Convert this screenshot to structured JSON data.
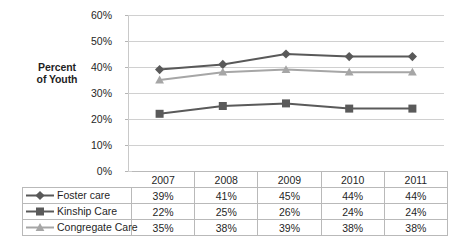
{
  "chart_data": {
    "type": "line",
    "title": "",
    "xlabel": "",
    "ylabel": "Percent of Youth",
    "ylabel_line1": "Percent",
    "ylabel_line2": "of Youth",
    "categories": [
      "2007",
      "2008",
      "2009",
      "2010",
      "2011"
    ],
    "ytick_labels": [
      "60%",
      "50%",
      "40%",
      "30%",
      "20%",
      "10%",
      "0%"
    ],
    "ytick_values": [
      60,
      50,
      40,
      30,
      20,
      10,
      0
    ],
    "ylim": [
      0,
      60
    ],
    "grid": true,
    "legend_position": "data-table-below",
    "series": [
      {
        "name": "Foster care",
        "marker": "diamond",
        "color": "#595959",
        "values": [
          39,
          41,
          45,
          44,
          44
        ],
        "labels": [
          "39%",
          "41%",
          "45%",
          "44%",
          "44%"
        ]
      },
      {
        "name": "Kinship Care",
        "marker": "square",
        "color": "#5a5a5a",
        "values": [
          22,
          25,
          26,
          24,
          24
        ],
        "labels": [
          "22%",
          "25%",
          "26%",
          "24%",
          "24%"
        ]
      },
      {
        "name": "Congregate Care",
        "marker": "triangle",
        "color": "#a6a6a6",
        "values": [
          35,
          38,
          39,
          38,
          38
        ],
        "labels": [
          "35%",
          "38%",
          "39%",
          "38%",
          "38%"
        ]
      }
    ]
  },
  "table": {
    "corner_label": "",
    "column_headers": [
      "2007",
      "2008",
      "2009",
      "2010",
      "2011"
    ],
    "rows": [
      {
        "label": "Foster care",
        "values": [
          "39%",
          "41%",
          "45%",
          "44%",
          "44%"
        ]
      },
      {
        "label": "Kinship Care",
        "values": [
          "22%",
          "25%",
          "26%",
          "24%",
          "24%"
        ]
      },
      {
        "label": "Congregate Care",
        "values": [
          "35%",
          "38%",
          "39%",
          "38%",
          "38%"
        ]
      }
    ]
  },
  "colors": {
    "foster": "#595959",
    "kinship": "#5a5a5a",
    "congregate": "#a6a6a6",
    "gridline": "#d0d0d0",
    "table_border": "#b9b9b9",
    "background": "#ffffff"
  }
}
